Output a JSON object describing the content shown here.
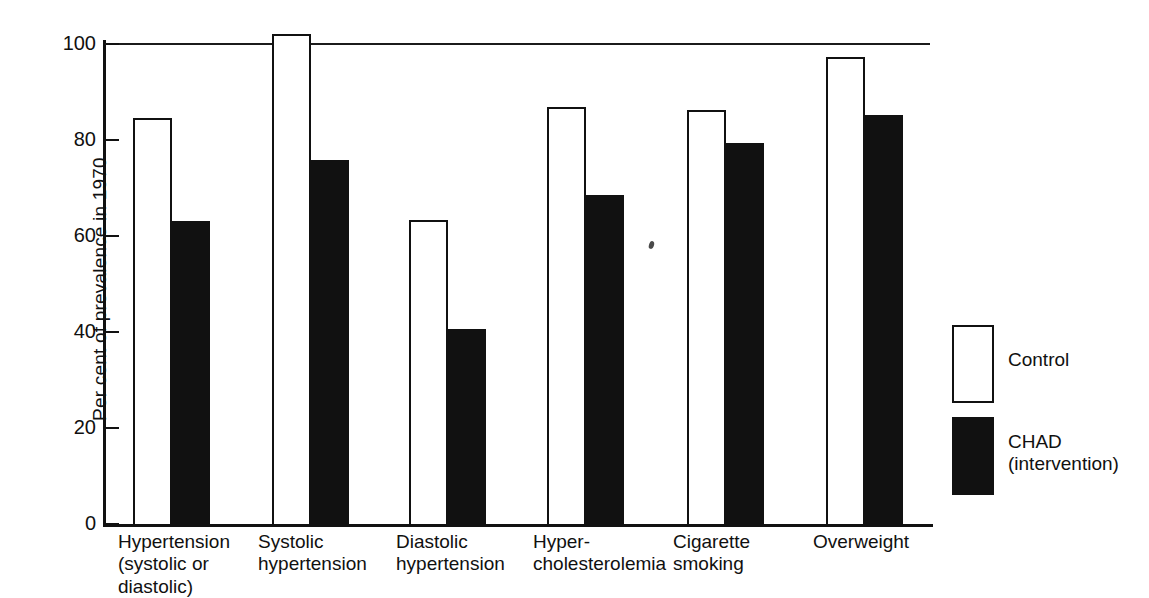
{
  "chart_data": {
    "type": "bar",
    "title": "",
    "xlabel": "",
    "ylabel": "Per cent of prevalence in 1970",
    "ylim": [
      0,
      100
    ],
    "yticks": [
      "0",
      "20",
      "40",
      "60",
      "80",
      "100"
    ],
    "grid": false,
    "legend_position": "right",
    "categories": [
      "Hypertension\n(systolic or\ndiastolic)",
      "Systolic\nhypertension",
      "Diastolic\nhypertension",
      "Hyper-\ncholesterolemia",
      "Cigarette\nsmoking",
      "Overweight"
    ],
    "series": [
      {
        "name": "Control",
        "values": [
          84.5,
          102.0,
          63.3,
          86.8,
          86.2,
          97.2
        ]
      },
      {
        "name": "CHAD\n(intervention)",
        "values": [
          63.0,
          75.8,
          40.6,
          68.5,
          79.3,
          85.1
        ]
      }
    ],
    "annotations": []
  },
  "axis": {
    "y_title": "Per cent of prevalence in 1970",
    "ticks": [
      {
        "label": "100",
        "value": 100
      },
      {
        "label": "80",
        "value": 80
      },
      {
        "label": "60",
        "value": 60
      },
      {
        "label": "40",
        "value": 40
      },
      {
        "label": "20",
        "value": 20
      },
      {
        "label": "0",
        "value": 0
      }
    ]
  },
  "legend": {
    "items": [
      {
        "label": "Control",
        "style": "outline",
        "color": "#ffffff"
      },
      {
        "label": "CHAD\n(intervention)",
        "style": "filled",
        "color": "#111111"
      }
    ]
  },
  "colors": {
    "control_fill": "#ffffff",
    "chad_fill": "#111111",
    "ink": "#111111",
    "background": "#ffffff"
  }
}
